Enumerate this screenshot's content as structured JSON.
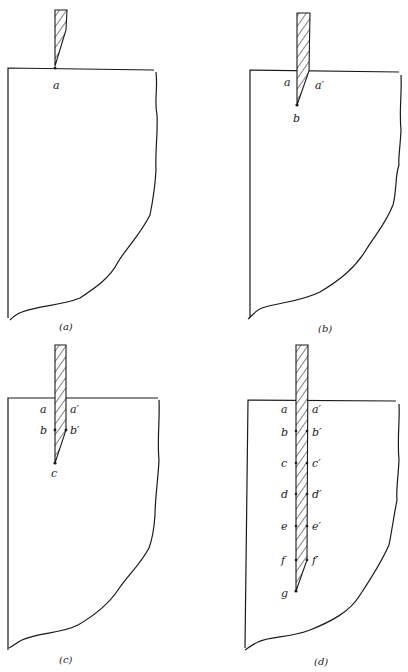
{
  "figure": {
    "colors": {
      "ink": "#1a1a1a",
      "background": "#ffffff"
    },
    "panels": [
      {
        "id": "a",
        "caption": "(a)",
        "labels_left": [
          "a"
        ],
        "labels_right": [],
        "tip_label": ""
      },
      {
        "id": "b",
        "caption": "(b)",
        "labels_left": [
          "a"
        ],
        "labels_right": [
          "a′"
        ],
        "tip_label": "b"
      },
      {
        "id": "c",
        "caption": "(c)",
        "labels_left": [
          "a",
          "b"
        ],
        "labels_right": [
          "a′",
          "b′"
        ],
        "tip_label": "c"
      },
      {
        "id": "d",
        "caption": "(d)",
        "labels_left": [
          "a",
          "b",
          "c",
          "d",
          "e",
          "f"
        ],
        "labels_right": [
          "a′",
          "b′",
          "c′",
          "d′",
          "e′",
          "f′"
        ],
        "tip_label": "g"
      }
    ]
  }
}
